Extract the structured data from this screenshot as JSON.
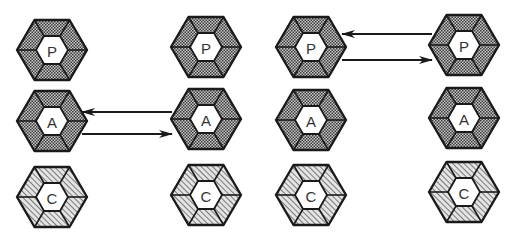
{
  "diagram": {
    "type": "hexagon-interaction-diagram",
    "colors": {
      "stroke": "#1a1a1a",
      "dotted_fill": "#8a8a8a",
      "hatched_fill": "#9a9a9a",
      "core_fill": "#ffffff",
      "label": "#333333"
    },
    "columns": [
      {
        "id": "col-1",
        "cx": 52,
        "nodes": [
          {
            "id": "c1-p",
            "label": "P",
            "cy": 50,
            "pattern": "dotted"
          },
          {
            "id": "c1-a",
            "label": "A",
            "cy": 121,
            "pattern": "dotted"
          },
          {
            "id": "c1-c",
            "label": "C",
            "cy": 197,
            "pattern": "hatched"
          }
        ]
      },
      {
        "id": "col-2",
        "cx": 206,
        "nodes": [
          {
            "id": "c2-p",
            "label": "P",
            "cy": 47,
            "pattern": "dotted"
          },
          {
            "id": "c2-a",
            "label": "A",
            "cy": 119,
            "pattern": "dotted"
          },
          {
            "id": "c2-c",
            "label": "C",
            "cy": 195,
            "pattern": "hatched"
          }
        ]
      },
      {
        "id": "col-3",
        "cx": 311,
        "nodes": [
          {
            "id": "c3-p",
            "label": "P",
            "cy": 47,
            "pattern": "dotted"
          },
          {
            "id": "c3-a",
            "label": "A",
            "cy": 120,
            "pattern": "dotted"
          },
          {
            "id": "c3-c",
            "label": "C",
            "cy": 195,
            "pattern": "hatched"
          }
        ]
      },
      {
        "id": "col-4",
        "cx": 464,
        "nodes": [
          {
            "id": "c4-p",
            "label": "P",
            "cy": 45,
            "pattern": "dotted"
          },
          {
            "id": "c4-a",
            "label": "A",
            "cy": 118,
            "pattern": "dotted"
          },
          {
            "id": "c4-c",
            "label": "C",
            "cy": 192,
            "pattern": "hatched"
          }
        ]
      }
    ],
    "arrows": [
      {
        "id": "arrow-a-left",
        "from": "c2-a",
        "to": "c1-a",
        "x1": 172,
        "y1": 112,
        "x2": 82,
        "y2": 112
      },
      {
        "id": "arrow-a-right",
        "from": "c1-a",
        "to": "c2-a",
        "x1": 82,
        "y1": 134,
        "x2": 172,
        "y2": 134
      },
      {
        "id": "arrow-p-left",
        "from": "c4-p",
        "to": "c3-p",
        "x1": 432,
        "y1": 34,
        "x2": 342,
        "y2": 34
      },
      {
        "id": "arrow-p-right",
        "from": "c3-p",
        "to": "c4-p",
        "x1": 342,
        "y1": 60,
        "x2": 432,
        "y2": 60
      }
    ]
  }
}
